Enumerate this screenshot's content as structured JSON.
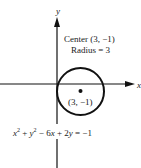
{
  "diagram": {
    "axes": {
      "x_label": "x",
      "y_label": "y"
    },
    "circle": {
      "center": [
        3,
        -1
      ],
      "radius": 3
    },
    "annotations": {
      "center_text": "Center (3, −1)",
      "radius_text": "Radius = 3",
      "point_label": "(3, −1)"
    },
    "equation": {
      "html": "x² + y² − 6x + 2y = −1",
      "parts": {
        "x": "x",
        "sup2a": "2",
        "plus1": " + ",
        "y": "y",
        "sup2b": "2",
        "rest1": " − 6",
        "x2": "x",
        "rest2": " + 2",
        "y2": "y",
        "rest3": " = −1"
      }
    },
    "colors": {
      "stroke": "#111111",
      "background": "#ffffff"
    }
  }
}
